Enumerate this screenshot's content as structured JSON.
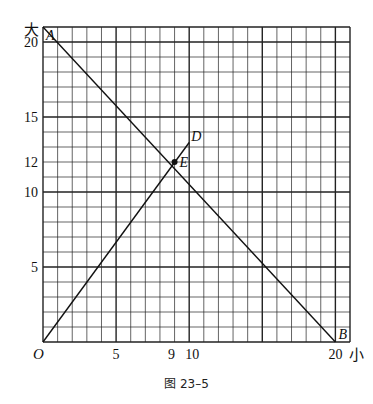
{
  "chart_data": {
    "type": "line",
    "title": "",
    "caption": "图 23–5",
    "xlabel": "小",
    "ylabel": "大",
    "xlim": [
      0,
      21
    ],
    "ylim": [
      0,
      21
    ],
    "grid": true,
    "x_ticks": [
      {
        "value": 0,
        "label": "O"
      },
      {
        "value": 5,
        "label": "5"
      },
      {
        "value": 9,
        "label": "9"
      },
      {
        "value": 10,
        "label": "10"
      },
      {
        "value": 20,
        "label": "20"
      }
    ],
    "y_ticks": [
      {
        "value": 5,
        "label": "5"
      },
      {
        "value": 10,
        "label": "10"
      },
      {
        "value": 12,
        "label": "12"
      },
      {
        "value": 15,
        "label": "15"
      },
      {
        "value": 20,
        "label": "20"
      }
    ],
    "series": [
      {
        "name": "AB",
        "points": [
          [
            0,
            21
          ],
          [
            20,
            0
          ]
        ],
        "labels": [
          "A",
          "B"
        ]
      },
      {
        "name": "OD",
        "points": [
          [
            0,
            0
          ],
          [
            10,
            13.3
          ]
        ],
        "labels": [
          "O",
          "D"
        ]
      }
    ],
    "annotations": [
      {
        "label": "E",
        "x": 9,
        "y": 12,
        "marker": "dot"
      }
    ]
  },
  "labels": {
    "axis_y": "大",
    "axis_x": "小",
    "origin": "O",
    "A": "A",
    "B": "B",
    "D": "D",
    "E": "E",
    "caption": "图 23–5"
  }
}
